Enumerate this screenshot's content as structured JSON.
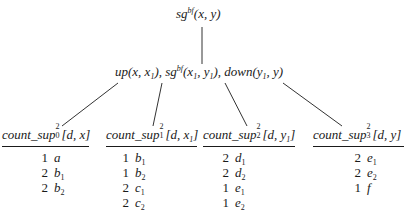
{
  "root": {
    "pred": "sg",
    "sup": "bf",
    "args": "(x, y)"
  },
  "middle": {
    "parts": [
      {
        "name": "up",
        "args_pre": "(x, x",
        "sub": "1",
        "args_post": ")"
      },
      {
        "name": "sg",
        "sup": "bf",
        "args": "(x₁, y₁)"
      },
      {
        "name": "down",
        "args": "(y₁, y)"
      }
    ],
    "text_up": "up(x, x",
    "text_up_sub": "1",
    "text_sep1": "), ",
    "text_sg": "sg",
    "text_sg_sup": "bf",
    "text_sg_open": "(x",
    "text_sg_sub1": "1",
    "text_sg_mid": ", y",
    "text_sg_sub2": "1",
    "text_sep2": "), ",
    "text_down": "down(y",
    "text_down_sub": "1",
    "text_down_end": ", y)"
  },
  "tables": [
    {
      "name": "count_sup",
      "sup": "2",
      "sub": "0",
      "args_pre": "[d, x",
      "args_sub": "",
      "args_post": "]",
      "rows": [
        {
          "count": "1",
          "val": "a",
          "sub": ""
        },
        {
          "count": "2",
          "val": "b",
          "sub": "1"
        },
        {
          "count": "2",
          "val": "b",
          "sub": "2"
        }
      ]
    },
    {
      "name": "count_sup",
      "sup": "2",
      "sub": "1",
      "args_pre": "[d, x",
      "args_sub": "1",
      "args_post": "]",
      "rows": [
        {
          "count": "1",
          "val": "b",
          "sub": "1"
        },
        {
          "count": "1",
          "val": "b",
          "sub": "2"
        },
        {
          "count": "2",
          "val": "c",
          "sub": "1"
        },
        {
          "count": "2",
          "val": "c",
          "sub": "2"
        }
      ]
    },
    {
      "name": "count_sup",
      "sup": "2",
      "sub": "2",
      "args_pre": "[d, y",
      "args_sub": "1",
      "args_post": "]",
      "rows": [
        {
          "count": "2",
          "val": "d",
          "sub": "1"
        },
        {
          "count": "2",
          "val": "d",
          "sub": "2"
        },
        {
          "count": "1",
          "val": "e",
          "sub": "1"
        },
        {
          "count": "1",
          "val": "e",
          "sub": "2"
        }
      ]
    },
    {
      "name": "count_sup",
      "sup": "2",
      "sub": "3",
      "args_pre": "[d, y",
      "args_sub": "",
      "args_post": "]",
      "rows": [
        {
          "count": "2",
          "val": "e",
          "sub": "1"
        },
        {
          "count": "2",
          "val": "e",
          "sub": "2"
        },
        {
          "count": "1",
          "val": "f",
          "sub": ""
        }
      ]
    }
  ]
}
